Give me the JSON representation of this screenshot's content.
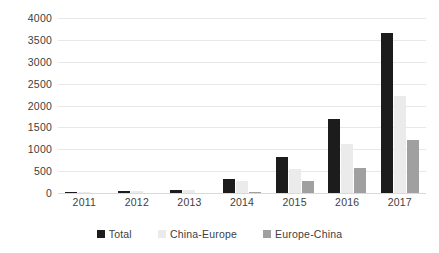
{
  "chart_data": {
    "type": "bar",
    "title": "",
    "subtitle": "",
    "xlabel": "",
    "ylabel": "",
    "categories": [
      "2011",
      "2012",
      "2013",
      "2014",
      "2015",
      "2016",
      "2017"
    ],
    "series": [
      {
        "name": "Total",
        "color": "#1c1c1c",
        "values": [
          17,
          42,
          80,
          310,
          815,
          1690,
          3660
        ]
      },
      {
        "name": "China-Europe",
        "color": "#ebebeb",
        "values": [
          17,
          42,
          80,
          280,
          550,
          1130,
          2210
        ]
      },
      {
        "name": "Europe-China",
        "color": "#a0a0a0",
        "values": [
          0,
          0,
          0,
          30,
          265,
          570,
          1210
        ]
      }
    ],
    "ylim": [
      0,
      4000
    ],
    "yticks": [
      0,
      500,
      1000,
      1500,
      2000,
      2500,
      3000,
      3500,
      4000
    ],
    "ytick_labels": [
      "0",
      "500",
      "1000",
      "1500",
      "2000",
      "2500",
      "3000",
      "3500",
      "4000"
    ],
    "grid": true,
    "legend_position": "bottom",
    "legend": [
      "Total",
      "China-Europe",
      "Europe-China"
    ]
  },
  "colors": {
    "background": "#ffffff",
    "gridline": "#e8e8e8",
    "axis_text": "#404040",
    "series_total": "#1c1c1c",
    "series_china_europe": "#ebebeb",
    "series_europe_china": "#a0a0a0"
  }
}
